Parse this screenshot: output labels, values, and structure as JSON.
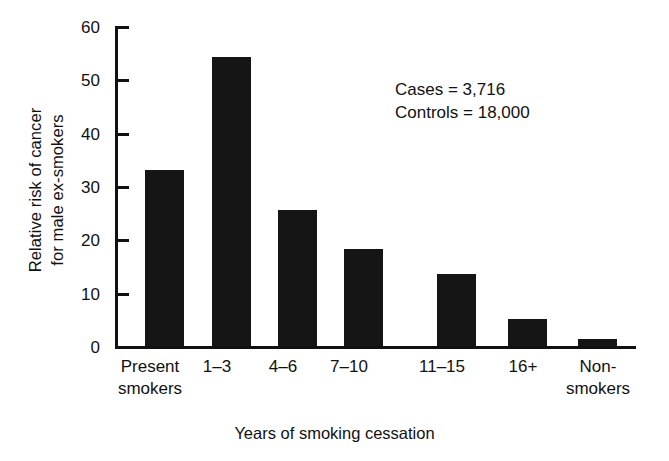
{
  "chart_data": {
    "type": "bar",
    "title": "",
    "xlabel": "Years of smoking cessation",
    "ylabel_lines": [
      "Relative risk of cancer",
      "for male ex-smokers"
    ],
    "ylabel": "Relative risk of cancer for male ex-smokers",
    "categories": [
      "Present smokers",
      "1–3",
      "4–6",
      "7–10",
      "11–15",
      "16+",
      "Non-smokers"
    ],
    "category_lines": [
      [
        "Present",
        "smokers"
      ],
      [
        "1–3"
      ],
      [
        "4–6"
      ],
      [
        "7–10"
      ],
      [
        "11–15"
      ],
      [
        "16+"
      ],
      [
        "Non-",
        "smokers"
      ]
    ],
    "values": [
      33,
      54.2,
      25.5,
      18.2,
      13.6,
      5.1,
      1.3
    ],
    "ylim": [
      0,
      60
    ],
    "yticks": [
      0,
      10,
      20,
      30,
      40,
      50,
      60
    ],
    "ytick_labels": [
      "0",
      "10",
      "20",
      "30",
      "40",
      "50",
      "60"
    ],
    "grid": false,
    "legend": false,
    "bar_color": "#151515",
    "axis_color": "#111111"
  },
  "annotation": {
    "cases_line": "Cases = 3,716",
    "controls_line": "Controls = 18,000"
  }
}
